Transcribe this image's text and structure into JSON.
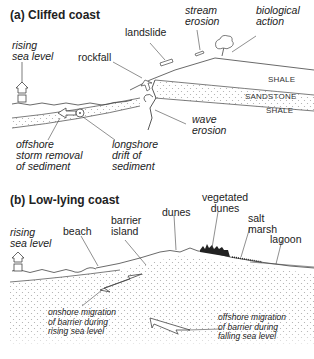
{
  "panel_a": {
    "title": "(a) Cliffed coast",
    "labels": {
      "rising_sea_level": [
        "rising",
        "sea level"
      ],
      "landslide": "landslide",
      "stream_erosion": [
        "stream",
        "erosion"
      ],
      "biological_action": [
        "biological",
        "action"
      ],
      "rockfall": "rockfall",
      "wave_erosion": [
        "wave",
        "erosion"
      ],
      "offshore_storm_removal": [
        "offshore",
        "storm removal",
        "of sediment"
      ],
      "longshore_drift": [
        "longshore",
        "drift of",
        "sediment"
      ]
    },
    "strata": [
      "SHALE",
      "SANDSTONE",
      "SHALE"
    ]
  },
  "panel_b": {
    "title": "(b) Low-lying coast",
    "labels": {
      "rising_sea_level": [
        "rising",
        "sea level"
      ],
      "beach": "beach",
      "barrier_island": [
        "barrier",
        "island"
      ],
      "dunes": "dunes",
      "vegetated_dunes": [
        "vegetated",
        "dunes"
      ],
      "salt_marsh": [
        "salt",
        "marsh"
      ],
      "lagoon": "lagoon",
      "onshore_migration": [
        "onshore migration",
        "of barrier during",
        "rising sea level"
      ],
      "offshore_migration": [
        "offshore migration",
        "of barrier during",
        "falling sea level"
      ]
    }
  },
  "colors": {
    "line": "#333333",
    "stipple": "#bbbbbb",
    "background": "#ffffff"
  }
}
